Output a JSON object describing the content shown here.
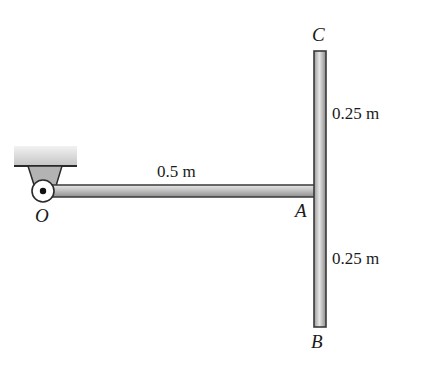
{
  "diagram": {
    "type": "mechanics-free-body",
    "points": {
      "O": "O",
      "A": "A",
      "B": "B",
      "C": "C"
    },
    "dimensions": {
      "OA": "0.5 m",
      "AC": "0.25 m",
      "AB": "0.25 m"
    },
    "colors": {
      "rod_fill": "#c8c8c8",
      "rod_outline": "#3a3a3a",
      "support_fill": "#b0b0b0",
      "ground_fill": "#d4d4d4",
      "text": "#1a1a1a"
    }
  }
}
